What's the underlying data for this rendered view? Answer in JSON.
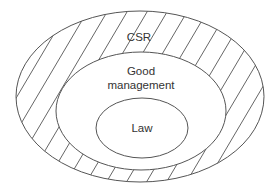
{
  "diagram": {
    "type": "nested-ellipses",
    "colors": {
      "stroke": "#555555",
      "text": "#333333",
      "background": "#ffffff",
      "hatch": "#555555"
    },
    "regions": [
      {
        "id": "csr",
        "label": "CSR",
        "hatched": true
      },
      {
        "id": "good-management",
        "label_line1": "Good",
        "label_line2": "management",
        "hatched": false
      },
      {
        "id": "law",
        "label": "Law",
        "hatched": false
      }
    ]
  }
}
